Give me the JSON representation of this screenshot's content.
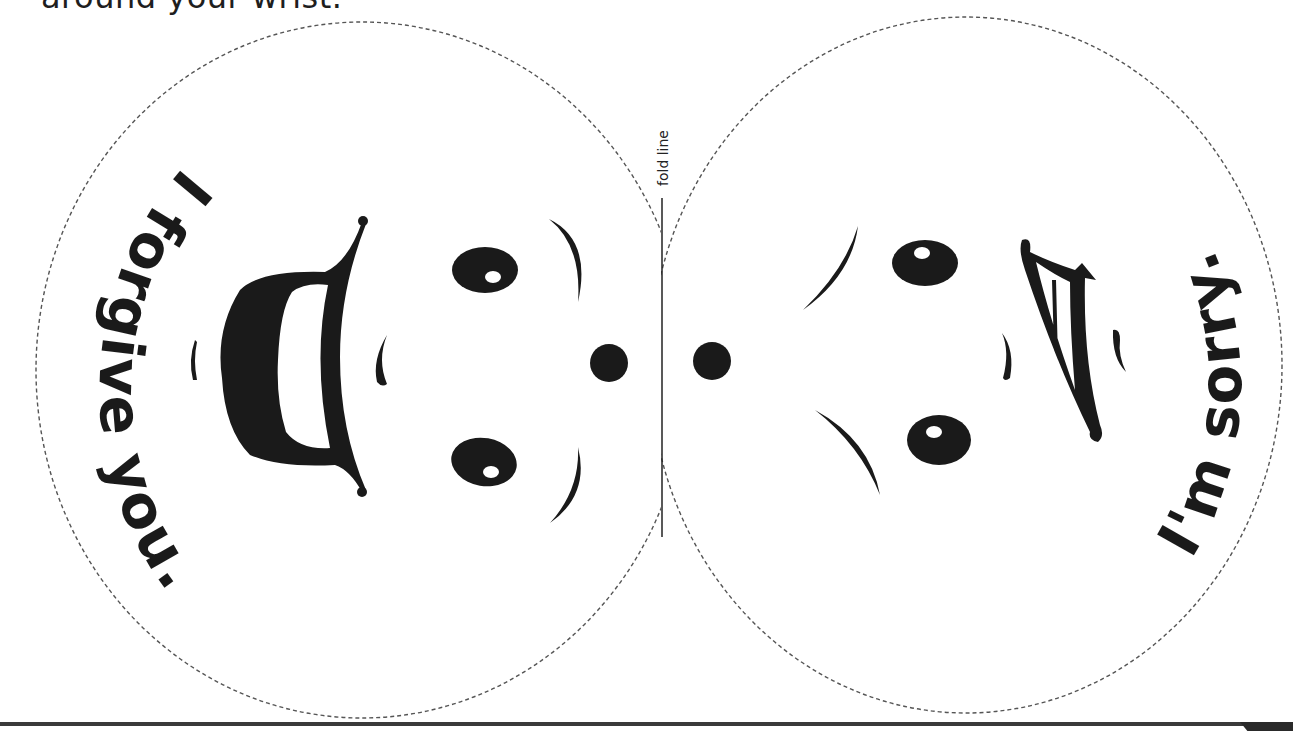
{
  "instruction": {
    "text": "around your wrist."
  },
  "fold": {
    "label": "fold line"
  },
  "left_face": {
    "expression": "happy",
    "message": "I forgive you."
  },
  "right_face": {
    "expression": "sad",
    "message": "I'm sorry."
  },
  "colors": {
    "ink": "#1a1a1a",
    "dash": "#555555",
    "background": "#ffffff"
  }
}
